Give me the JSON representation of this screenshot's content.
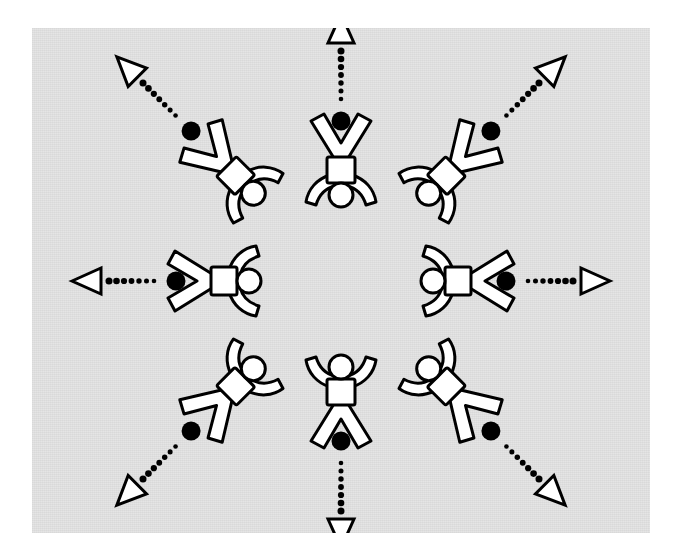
{
  "figure": {
    "canvas": {
      "width": 680,
      "height": 557
    },
    "panel": {
      "x": 32,
      "y": 28,
      "width": 618,
      "height": 505,
      "fill": "#e3e3e3"
    },
    "center": {
      "x": 341,
      "y": 281
    },
    "colors": {
      "background": "#ffffff",
      "panel": "#e3e3e3",
      "ink": "#000000",
      "figure_fill": "#ffffff",
      "dot": "#000000",
      "arrow_fill": "#ffffff"
    },
    "style": {
      "figure_stroke_width": 3,
      "arrow_stroke_width": 3,
      "dot_radius": 9.5,
      "trail_dot_radius": 3.2,
      "trail_dot_count": 7
    }
  },
  "elements": {
    "person_count": 8,
    "dot_count": 8,
    "arrow_count": 8,
    "arrow_head_shape": "open-triangle",
    "arrow_line_style": "dotted",
    "figure_pose": "arms-raised-legs-apart",
    "layout": "radial-ring-heads-inward"
  },
  "people": [
    {
      "id": "person-n",
      "label": "top",
      "angle_deg": 270,
      "radius": 112,
      "rotation_deg": 180,
      "flip": false
    },
    {
      "id": "person-ne",
      "label": "top-right",
      "angle_deg": 315,
      "radius": 150,
      "rotation_deg": 225,
      "flip": false
    },
    {
      "id": "person-e",
      "label": "right",
      "angle_deg": 0,
      "radius": 118,
      "rotation_deg": 270,
      "flip": false
    },
    {
      "id": "person-se",
      "label": "bottom-right",
      "angle_deg": 45,
      "radius": 150,
      "rotation_deg": 315,
      "flip": false
    },
    {
      "id": "person-s",
      "label": "bottom",
      "angle_deg": 90,
      "radius": 112,
      "rotation_deg": 0,
      "flip": false
    },
    {
      "id": "person-sw",
      "label": "bottom-left",
      "angle_deg": 135,
      "radius": 150,
      "rotation_deg": 45,
      "flip": false
    },
    {
      "id": "person-w",
      "label": "left",
      "angle_deg": 180,
      "radius": 118,
      "rotation_deg": 90,
      "flip": false
    },
    {
      "id": "person-nw",
      "label": "top-left",
      "angle_deg": 225,
      "radius": 150,
      "rotation_deg": 135,
      "flip": false
    }
  ],
  "dots": [
    {
      "id": "dot-n",
      "angle_deg": 270,
      "radius": 160
    },
    {
      "id": "dot-ne",
      "angle_deg": 315,
      "radius": 212
    },
    {
      "id": "dot-e",
      "angle_deg": 0,
      "radius": 165
    },
    {
      "id": "dot-se",
      "angle_deg": 45,
      "radius": 212
    },
    {
      "id": "dot-s",
      "angle_deg": 90,
      "radius": 160
    },
    {
      "id": "dot-sw",
      "angle_deg": 135,
      "radius": 212
    },
    {
      "id": "dot-w",
      "angle_deg": 180,
      "radius": 165
    },
    {
      "id": "dot-nw",
      "angle_deg": 225,
      "radius": 212
    }
  ],
  "arrows": [
    {
      "id": "arrow-n",
      "angle_deg": 270,
      "start_radius": 182,
      "end_radius": 250
    },
    {
      "id": "arrow-ne",
      "angle_deg": 315,
      "start_radius": 234,
      "end_radius": 300
    },
    {
      "id": "arrow-e",
      "angle_deg": 0,
      "start_radius": 187,
      "end_radius": 252
    },
    {
      "id": "arrow-se",
      "angle_deg": 45,
      "start_radius": 234,
      "end_radius": 300
    },
    {
      "id": "arrow-s",
      "angle_deg": 90,
      "start_radius": 182,
      "end_radius": 250
    },
    {
      "id": "arrow-sw",
      "angle_deg": 135,
      "start_radius": 234,
      "end_radius": 300
    },
    {
      "id": "arrow-w",
      "angle_deg": 180,
      "start_radius": 187,
      "end_radius": 252
    },
    {
      "id": "arrow-nw",
      "angle_deg": 225,
      "start_radius": 234,
      "end_radius": 300
    }
  ]
}
